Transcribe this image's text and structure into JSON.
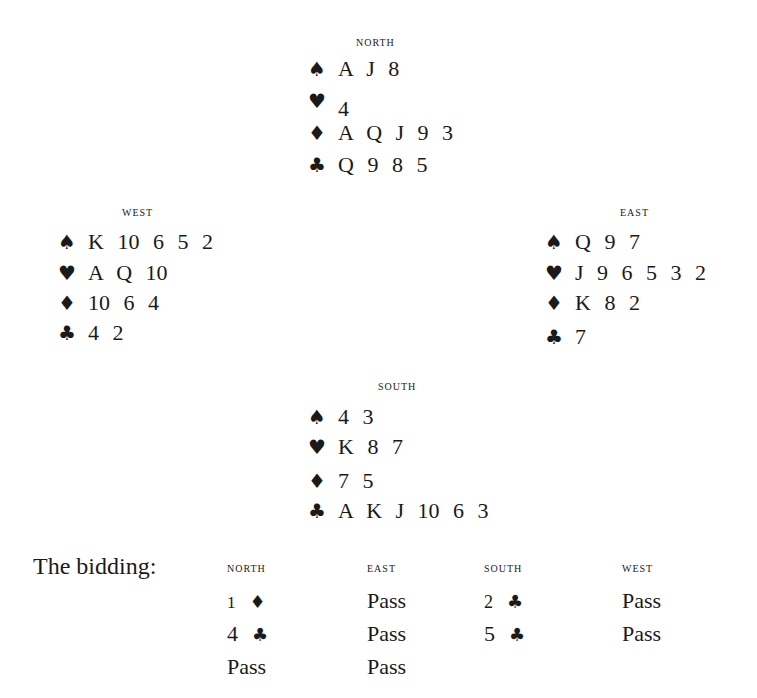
{
  "hands": {
    "north": {
      "label": "NORTH",
      "spades": "A  J  8",
      "hearts": "4",
      "diamonds": "A  Q  J  9  3",
      "clubs": "Q  9  8  5"
    },
    "west": {
      "label": "WEST",
      "spades": "K  10  6  5  2",
      "hearts": "A  Q  10",
      "diamonds": "10  6  4",
      "clubs": "4  2"
    },
    "east": {
      "label": "EAST",
      "spades": "Q  9  7",
      "hearts": "J  9  6  5  3  2",
      "diamonds": "K  8  2",
      "clubs": "7"
    },
    "south": {
      "label": "SOUTH",
      "spades": "4  3",
      "hearts": "K  8  7",
      "diamonds": "7  5",
      "clubs": "A  K  J  10  6  3"
    }
  },
  "suits": {
    "spades": "♠",
    "hearts": "♥",
    "diamonds": "♦",
    "clubs": "♣"
  },
  "bidding": {
    "label": "The bidding:",
    "columns": [
      "NORTH",
      "EAST",
      "SOUTH",
      "WEST"
    ],
    "rounds": [
      {
        "north": {
          "level": "1",
          "suit": "♦"
        },
        "east": "Pass",
        "south": {
          "level": "2",
          "suit": "♣"
        },
        "west": "Pass"
      },
      {
        "north": {
          "level": "4",
          "suit": "♣"
        },
        "east": "Pass",
        "south": {
          "level": "5",
          "suit": "♣"
        },
        "west": "Pass"
      },
      {
        "north": "Pass",
        "east": "Pass"
      }
    ]
  }
}
